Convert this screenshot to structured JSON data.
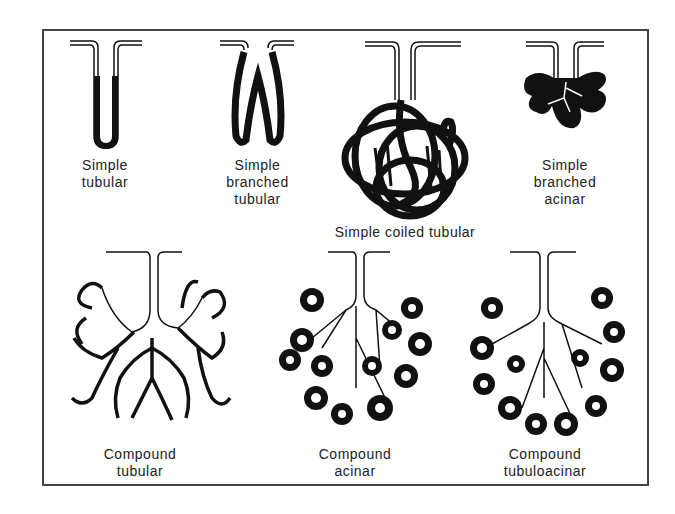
{
  "diagram": {
    "glands": [
      {
        "id": "simple-tubular",
        "label": "Simple\ntubular"
      },
      {
        "id": "simple-branched-tubular",
        "label": "Simple\nbranched\ntubular"
      },
      {
        "id": "simple-coiled-tubular",
        "label": "Simple coiled tubular"
      },
      {
        "id": "simple-branched-acinar",
        "label": "Simple\nbranched\nacinar"
      },
      {
        "id": "compound-tubular",
        "label": "Compound\ntubular"
      },
      {
        "id": "compound-acinar",
        "label": "Compound\nacinar"
      },
      {
        "id": "compound-tubuloacinar",
        "label": "Compound\ntubuloacinar"
      }
    ]
  },
  "colors": {
    "ink": "#111111",
    "frame": "#444444",
    "background": "#ffffff"
  }
}
